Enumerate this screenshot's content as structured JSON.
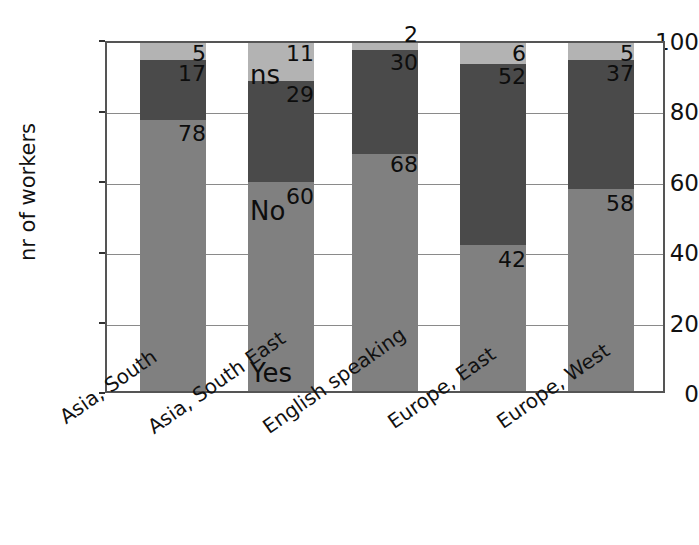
{
  "chart_data": {
    "type": "bar",
    "subtype": "stacked-bar",
    "title": "",
    "xlabel": "",
    "ylabel": "nr of workers",
    "ylim": [
      0,
      100
    ],
    "yticks": [
      0,
      20,
      40,
      60,
      80,
      100
    ],
    "ytick_labels": [
      "0",
      "20",
      "40",
      "60",
      "80",
      "100"
    ],
    "grid": true,
    "grid_axis": "y",
    "legend": "inline-annotations",
    "categories": [
      "Asia, South",
      "Asia, South East",
      "English speaking",
      "Europe, East",
      "Europe, West"
    ],
    "series": [
      {
        "name": "Yes",
        "color": "#808080",
        "values": [
          78,
          60,
          68,
          42,
          58
        ],
        "labels": [
          "78",
          "60",
          "68",
          "42",
          "58"
        ]
      },
      {
        "name": "No",
        "color": "#4a4a4a",
        "values": [
          17,
          29,
          30,
          52,
          37
        ],
        "labels": [
          "17",
          "29",
          "30",
          "52",
          "37"
        ]
      },
      {
        "name": "ns",
        "color": "#b3b3b3",
        "values": [
          5,
          11,
          2,
          6,
          5
        ],
        "labels": [
          "5",
          "11",
          "2",
          "6",
          "5"
        ]
      }
    ],
    "annotations": [
      {
        "text": "ns",
        "category": "Asia, South East",
        "series": "ns"
      },
      {
        "text": "No",
        "category": "Asia, South East",
        "series": "No"
      },
      {
        "text": "Yes",
        "category": "Asia, South East",
        "series": "Yes"
      }
    ]
  },
  "axis": {
    "y_title": "nr of workers",
    "y_tick_0": "0",
    "y_tick_20": "20",
    "y_tick_40": "40",
    "y_tick_60": "60",
    "y_tick_80": "80",
    "y_tick_100": "100"
  },
  "x_labels": {
    "c0": "Asia, South",
    "c1": "Asia, South East",
    "c2": "English speaking",
    "c3": "Europe, East",
    "c4": "Europe, West"
  },
  "values": {
    "b0_yes": "78",
    "b0_no": "17",
    "b0_ns": "5",
    "b1_yes": "60",
    "b1_no": "29",
    "b1_ns": "11",
    "b2_yes": "68",
    "b2_no": "30",
    "b2_ns": "2",
    "b3_yes": "42",
    "b3_no": "52",
    "b3_ns": "6",
    "b4_yes": "58",
    "b4_no": "37",
    "b4_ns": "5"
  },
  "series_labels": {
    "ns": "ns",
    "no": "No",
    "yes": "Yes"
  },
  "colors": {
    "yes": "#808080",
    "no": "#4a4a4a",
    "ns": "#b3b3b3",
    "axis": "#555555",
    "grid": "#8a8a8a",
    "text": "#111111",
    "background": "#ffffff"
  }
}
